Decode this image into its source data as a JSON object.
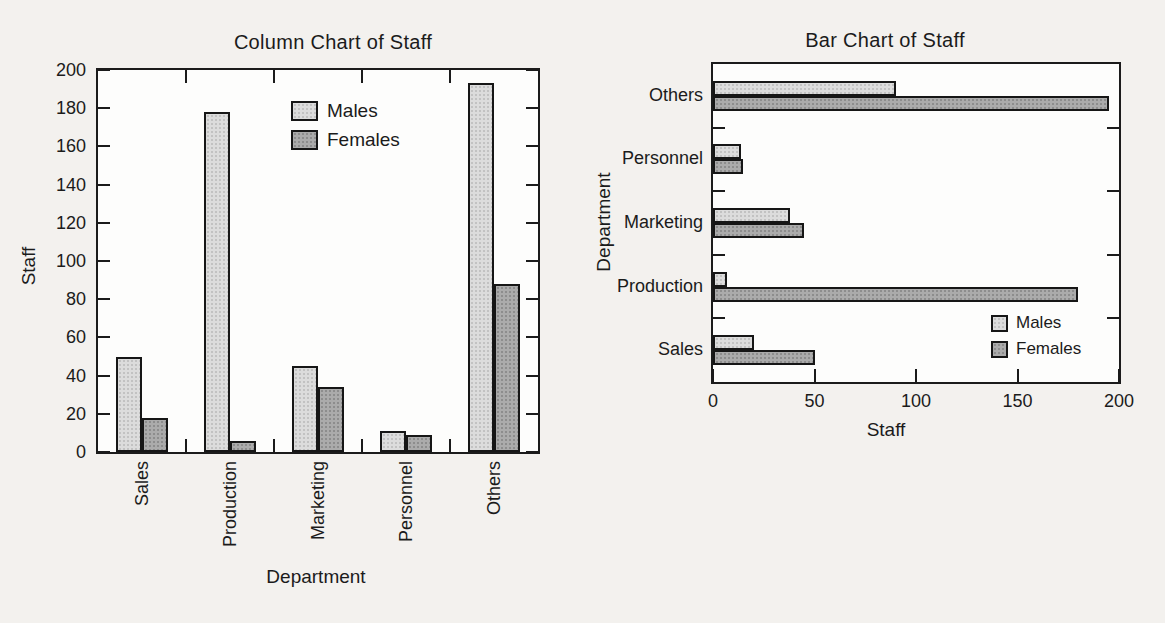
{
  "page": {
    "background": "#f3f1ee",
    "paper_white": "#fdfdfc",
    "ink": "#1b1b1b"
  },
  "chart_data": [
    {
      "type": "bar",
      "orientation": "vertical",
      "title": "Column Chart of Staff",
      "xlabel": "Department",
      "ylabel": "Staff",
      "categories": [
        "Sales",
        "Production",
        "Marketing",
        "Personnel",
        "Others"
      ],
      "series": [
        {
          "name": "Males",
          "color": "#dcdcdc",
          "values": [
            50,
            178,
            45,
            11,
            193
          ]
        },
        {
          "name": "Females",
          "color": "#ababab",
          "values": [
            18,
            6,
            34,
            9,
            88
          ]
        }
      ],
      "ylim": [
        0,
        200
      ],
      "yticks": [
        0,
        20,
        40,
        60,
        80,
        100,
        120,
        140,
        160,
        180,
        200
      ],
      "grid": false,
      "legend_position": "inside-top-center"
    },
    {
      "type": "bar",
      "orientation": "horizontal",
      "title": "Bar Chart of Staff",
      "xlabel": "Staff",
      "ylabel": "Department",
      "categories": [
        "Sales",
        "Production",
        "Marketing",
        "Personnel",
        "Others"
      ],
      "categories_note": "listed bottom-to-top as displayed",
      "series": [
        {
          "name": "Males",
          "color": "#dcdcdc",
          "values": [
            20,
            7,
            38,
            14,
            90
          ]
        },
        {
          "name": "Females",
          "color": "#ababab",
          "values": [
            50,
            180,
            45,
            15,
            195
          ]
        }
      ],
      "xlim": [
        0,
        200
      ],
      "xticks": [
        0,
        50,
        100,
        150,
        200
      ],
      "grid": false,
      "legend_position": "inside-bottom-right"
    }
  ]
}
